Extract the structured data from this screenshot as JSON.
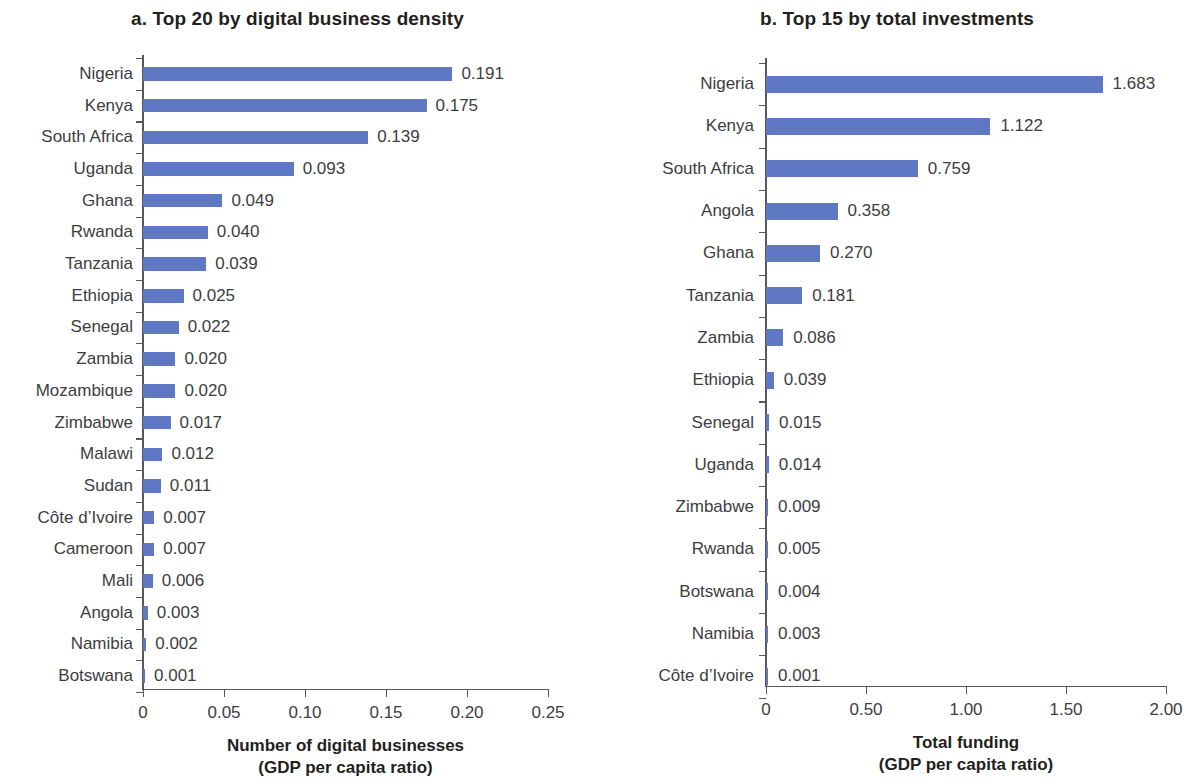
{
  "figure": {
    "background_color": "#ffffff",
    "bar_color": "#5e78c4",
    "axis_color": "#58585b",
    "text_color": "#3d3d40"
  },
  "chart_data": [
    {
      "type": "bar",
      "orientation": "horizontal",
      "panel_id": "a",
      "title": "a. Top 20 by digital business density",
      "xlabel": "Number of digital businesses",
      "xlabel_line2": "(GDP per capita ratio)",
      "ylabel": "",
      "xlim": [
        0,
        0.25
      ],
      "xticks": [
        0,
        0.05,
        0.1,
        0.15,
        0.2,
        0.25
      ],
      "xtick_labels": [
        "0",
        "0.05",
        "0.10",
        "0.15",
        "0.20",
        "0.25"
      ],
      "grid": false,
      "legend": false,
      "categories": [
        "Nigeria",
        "Kenya",
        "South Africa",
        "Uganda",
        "Ghana",
        "Rwanda",
        "Tanzania",
        "Ethiopia",
        "Senegal",
        "Zambia",
        "Mozambique",
        "Zimbabwe",
        "Malawi",
        "Sudan",
        "Côte d’Ivoire",
        "Cameroon",
        "Mali",
        "Angola",
        "Namibia",
        "Botswana"
      ],
      "values": [
        0.191,
        0.175,
        0.139,
        0.093,
        0.049,
        0.04,
        0.039,
        0.025,
        0.022,
        0.02,
        0.02,
        0.017,
        0.012,
        0.011,
        0.007,
        0.007,
        0.006,
        0.003,
        0.002,
        0.001
      ],
      "value_labels": [
        "0.191",
        "0.175",
        "0.139",
        "0.093",
        "0.049",
        "0.040",
        "0.039",
        "0.025",
        "0.022",
        "0.020",
        "0.020",
        "0.017",
        "0.012",
        "0.011",
        "0.007",
        "0.007",
        "0.006",
        "0.003",
        "0.002",
        "0.001"
      ]
    },
    {
      "type": "bar",
      "orientation": "horizontal",
      "panel_id": "b",
      "title": "b. Top 15 by total investments",
      "xlabel": "Total funding",
      "xlabel_line2": "(GDP per capita ratio)",
      "ylabel": "",
      "xlim": [
        0,
        2.0
      ],
      "xticks": [
        0,
        0.5,
        1.0,
        1.5,
        2.0
      ],
      "xtick_labels": [
        "0",
        "0.50",
        "1.00",
        "1.50",
        "2.00"
      ],
      "grid": false,
      "legend": false,
      "categories": [
        "Nigeria",
        "Kenya",
        "South Africa",
        "Angola",
        "Ghana",
        "Tanzania",
        "Zambia",
        "Ethiopia",
        "Senegal",
        "Uganda",
        "Zimbabwe",
        "Rwanda",
        "Botswana",
        "Namibia",
        "Côte d’Ivoire"
      ],
      "values": [
        1.683,
        1.122,
        0.759,
        0.358,
        0.27,
        0.181,
        0.086,
        0.039,
        0.015,
        0.014,
        0.009,
        0.005,
        0.004,
        0.003,
        0.001
      ],
      "value_labels": [
        "1.683",
        "1.122",
        "0.759",
        "0.358",
        "0.270",
        "0.181",
        "0.086",
        "0.039",
        "0.015",
        "0.014",
        "0.009",
        "0.005",
        "0.004",
        "0.003",
        "0.001"
      ]
    }
  ]
}
